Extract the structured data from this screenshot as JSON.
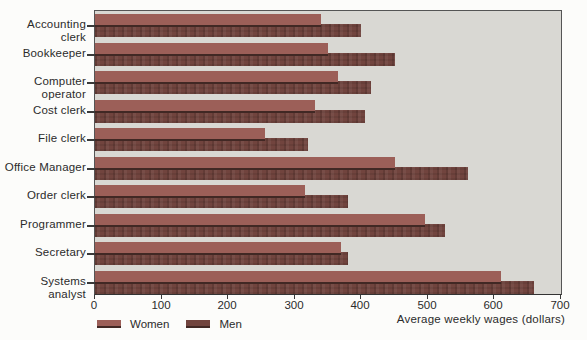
{
  "chart_data": {
    "type": "bar",
    "orientation": "horizontal",
    "title": "",
    "xlabel": "Average weekly wages (dollars)",
    "categories": [
      "Accounting clerk",
      "Bookkeeper",
      "Computer operator",
      "Cost clerk",
      "File clerk",
      "Office Manager",
      "Order clerk",
      "Programmer",
      "Secretary",
      "Systems analyst"
    ],
    "series": [
      {
        "name": "Women",
        "color": "#9c5f58",
        "values": [
          340,
          350,
          365,
          330,
          255,
          450,
          315,
          495,
          370,
          610
        ]
      },
      {
        "name": "Men",
        "color": "#71443e",
        "values": [
          400,
          450,
          415,
          405,
          320,
          560,
          380,
          525,
          380,
          660
        ]
      }
    ],
    "xlim": [
      0,
      700
    ],
    "xticks": [
      0,
      100,
      200,
      300,
      400,
      500,
      600,
      700
    ],
    "grid": false,
    "legend_position": "bottom-left",
    "plot_background": "#d9d8d3",
    "axis_color": "#3a3a3a"
  }
}
